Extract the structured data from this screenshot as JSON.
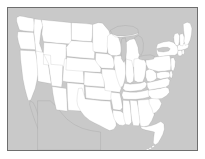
{
  "map": {
    "title": "United States state outline map",
    "projection_note": "contiguous United States",
    "colors": {
      "land_fill": "#ffffff",
      "background": "#c9c9c9",
      "border_stroke": "#5a5a5a",
      "frame_stroke": "#6e6e6e",
      "page_background": "#ffffff"
    },
    "frame": {
      "x": 7,
      "y": 7,
      "width": 191,
      "height": 144
    },
    "features": {
      "states_shown": true,
      "state_labels_shown": false,
      "city_labels_shown": false,
      "legend_shown": false,
      "graticule_shown": false,
      "great_lakes_shown": true,
      "florida_keys_shown": true,
      "baja_peninsula_shown": true,
      "canada_shown": true,
      "mexico_shown": true
    },
    "regions": [
      {
        "name": "Washington",
        "abbr": "WA",
        "fill": "#ffffff"
      },
      {
        "name": "Oregon",
        "abbr": "OR",
        "fill": "#ffffff"
      },
      {
        "name": "California",
        "abbr": "CA",
        "fill": "#ffffff"
      },
      {
        "name": "Idaho",
        "abbr": "ID",
        "fill": "#ffffff"
      },
      {
        "name": "Nevada",
        "abbr": "NV",
        "fill": "#ffffff"
      },
      {
        "name": "Montana",
        "abbr": "MT",
        "fill": "#ffffff"
      },
      {
        "name": "Wyoming",
        "abbr": "WY",
        "fill": "#ffffff"
      },
      {
        "name": "Utah",
        "abbr": "UT",
        "fill": "#ffffff"
      },
      {
        "name": "Arizona",
        "abbr": "AZ",
        "fill": "#ffffff"
      },
      {
        "name": "Colorado",
        "abbr": "CO",
        "fill": "#ffffff"
      },
      {
        "name": "New Mexico",
        "abbr": "NM",
        "fill": "#ffffff"
      },
      {
        "name": "North Dakota",
        "abbr": "ND",
        "fill": "#ffffff"
      },
      {
        "name": "South Dakota",
        "abbr": "SD",
        "fill": "#ffffff"
      },
      {
        "name": "Nebraska",
        "abbr": "NE",
        "fill": "#ffffff"
      },
      {
        "name": "Kansas",
        "abbr": "KS",
        "fill": "#ffffff"
      },
      {
        "name": "Oklahoma",
        "abbr": "OK",
        "fill": "#ffffff"
      },
      {
        "name": "Texas",
        "abbr": "TX",
        "fill": "#ffffff"
      },
      {
        "name": "Minnesota",
        "abbr": "MN",
        "fill": "#ffffff"
      },
      {
        "name": "Iowa",
        "abbr": "IA",
        "fill": "#ffffff"
      },
      {
        "name": "Missouri",
        "abbr": "MO",
        "fill": "#ffffff"
      },
      {
        "name": "Arkansas",
        "abbr": "AR",
        "fill": "#ffffff"
      },
      {
        "name": "Louisiana",
        "abbr": "LA",
        "fill": "#ffffff"
      },
      {
        "name": "Wisconsin",
        "abbr": "WI",
        "fill": "#ffffff"
      },
      {
        "name": "Illinois",
        "abbr": "IL",
        "fill": "#ffffff"
      },
      {
        "name": "Michigan",
        "abbr": "MI",
        "fill": "#ffffff"
      },
      {
        "name": "Indiana",
        "abbr": "IN",
        "fill": "#ffffff"
      },
      {
        "name": "Ohio",
        "abbr": "OH",
        "fill": "#ffffff"
      },
      {
        "name": "Kentucky",
        "abbr": "KY",
        "fill": "#ffffff"
      },
      {
        "name": "Tennessee",
        "abbr": "TN",
        "fill": "#ffffff"
      },
      {
        "name": "Mississippi",
        "abbr": "MS",
        "fill": "#ffffff"
      },
      {
        "name": "Alabama",
        "abbr": "AL",
        "fill": "#ffffff"
      },
      {
        "name": "Georgia",
        "abbr": "GA",
        "fill": "#ffffff"
      },
      {
        "name": "Florida",
        "abbr": "FL",
        "fill": "#ffffff"
      },
      {
        "name": "South Carolina",
        "abbr": "SC",
        "fill": "#ffffff"
      },
      {
        "name": "North Carolina",
        "abbr": "NC",
        "fill": "#ffffff"
      },
      {
        "name": "Virginia",
        "abbr": "VA",
        "fill": "#ffffff"
      },
      {
        "name": "West Virginia",
        "abbr": "WV",
        "fill": "#ffffff"
      },
      {
        "name": "Maryland",
        "abbr": "MD",
        "fill": "#ffffff"
      },
      {
        "name": "Delaware",
        "abbr": "DE",
        "fill": "#ffffff"
      },
      {
        "name": "Pennsylvania",
        "abbr": "PA",
        "fill": "#ffffff"
      },
      {
        "name": "New Jersey",
        "abbr": "NJ",
        "fill": "#ffffff"
      },
      {
        "name": "New York",
        "abbr": "NY",
        "fill": "#ffffff"
      },
      {
        "name": "Connecticut",
        "abbr": "CT",
        "fill": "#ffffff"
      },
      {
        "name": "Rhode Island",
        "abbr": "RI",
        "fill": "#ffffff"
      },
      {
        "name": "Massachusetts",
        "abbr": "MA",
        "fill": "#ffffff"
      },
      {
        "name": "Vermont",
        "abbr": "VT",
        "fill": "#ffffff"
      },
      {
        "name": "New Hampshire",
        "abbr": "NH",
        "fill": "#ffffff"
      },
      {
        "name": "Maine",
        "abbr": "ME",
        "fill": "#ffffff"
      }
    ]
  }
}
